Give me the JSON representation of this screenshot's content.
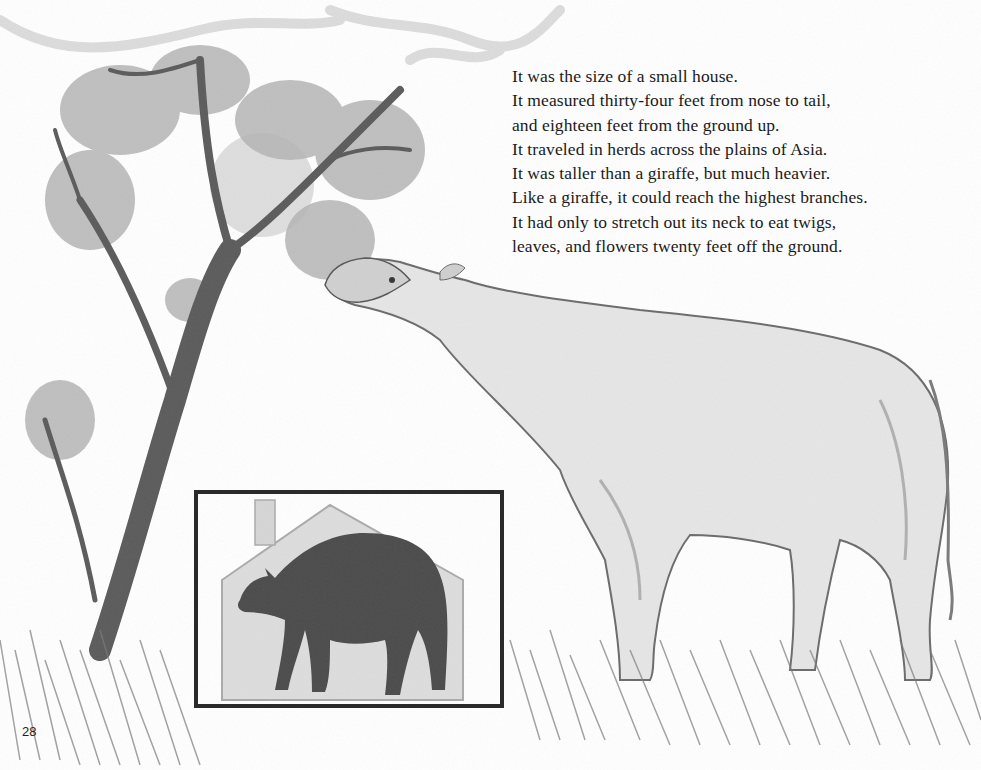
{
  "page": {
    "page_number": "28",
    "text_lines": [
      "It was the size of a small house.",
      "It measured thirty-four feet from nose to tail,",
      "and eighteen feet from the ground up.",
      "It traveled in herds across the plains of Asia.",
      "It was taller than a giraffe, but much heavier.",
      "Like a giraffe, it could reach the highest branches.",
      "It had only to stretch out its neck to eat twigs,",
      "leaves, and flowers twenty feet off the ground."
    ],
    "illustration": {
      "main_subject": "pencil drawing of a large hornless rhinoceros-like animal (Paraceratherium) stretching its neck to eat from a tree",
      "inset": "dark silhouette of the animal standing in front of a small house outline for size comparison",
      "colors": {
        "paper": "#ffffff",
        "pencil_dark": "#3a3a3a",
        "pencil_mid": "#8a8a8a",
        "pencil_light": "#c8c8c8",
        "inset_frame": "#2a2a2a"
      }
    }
  }
}
